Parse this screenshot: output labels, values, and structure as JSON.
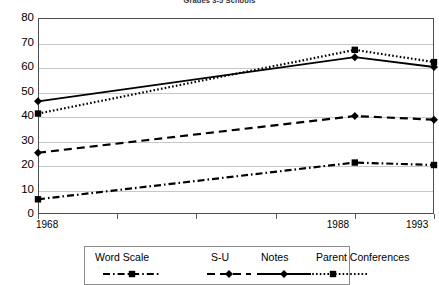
{
  "chart_data": {
    "type": "line",
    "title": "Grades 3-5 Schools",
    "xlabel": "",
    "ylabel": "",
    "x": [
      1968,
      1988,
      1993
    ],
    "categories": [
      "1968",
      "1988",
      "1993"
    ],
    "xlim": [
      1968,
      1993
    ],
    "ylim": [
      0,
      80
    ],
    "y_ticks": [
      0,
      10,
      20,
      30,
      40,
      50,
      60,
      70,
      80
    ],
    "x_tick_labels": [
      "1968",
      "1988",
      "1993"
    ],
    "grid": true,
    "legend_position": "bottom",
    "series": [
      {
        "name": "Word Scale",
        "values": [
          6,
          21,
          20
        ],
        "marker": "square",
        "dash": "dash-dot",
        "color": "#000000"
      },
      {
        "name": "S-U",
        "values": [
          25,
          40,
          38.5
        ],
        "marker": "diamond",
        "dash": "dashed",
        "color": "#000000"
      },
      {
        "name": "Notes",
        "values": [
          46,
          64,
          60
        ],
        "marker": "diamond",
        "dash": "solid",
        "color": "#000000"
      },
      {
        "name": "Parent Conferences",
        "values": [
          41,
          67,
          62
        ],
        "marker": "square",
        "dash": "dotted",
        "color": "#000000"
      }
    ]
  },
  "axis": {
    "y_labels": [
      "80",
      "70",
      "60",
      "50",
      "40",
      "30",
      "20",
      "10",
      "0"
    ],
    "x_labels": [
      "1968",
      "1988",
      "1993"
    ]
  },
  "legend": {
    "entries": [
      {
        "label": "Word Scale"
      },
      {
        "label": "S-U"
      },
      {
        "label": "Notes"
      },
      {
        "label": "Parent Conferences"
      }
    ]
  },
  "colors": {
    "axis": "#4d4d4d",
    "grid": "#c8c8c8",
    "series": "#000000",
    "background": "#ffffff"
  }
}
